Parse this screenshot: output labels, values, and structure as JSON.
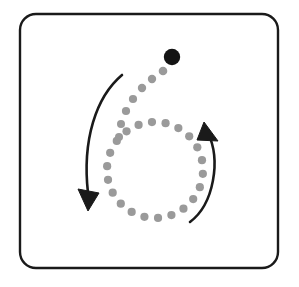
{
  "figure": {
    "canvas": {
      "width": 299,
      "height": 287,
      "background": "#ffffff"
    },
    "frame": {
      "label": "rounded-square-border",
      "x": 20,
      "y": 14,
      "width": 258,
      "height": 254,
      "corner_radius": 16,
      "stroke": "#1a1a1a",
      "stroke_width": 2.4,
      "fill": "#ffffff"
    },
    "ring": {
      "label": "dotted-circle-track",
      "center_x": 155,
      "center_y": 170,
      "radius": 48,
      "dot_count": 22,
      "dot_radius": 4.1,
      "color": "#9a9a9a",
      "start_angle_deg": -110
    },
    "tail": {
      "label": "spiral-lead-in-dots",
      "color": "#9a9a9a",
      "dots": [
        {
          "cx": 163,
          "cy": 71,
          "r": 4.3
        },
        {
          "cx": 152,
          "cy": 79,
          "r": 4.2
        },
        {
          "cx": 142,
          "cy": 88,
          "r": 4.2
        },
        {
          "cx": 133,
          "cy": 99,
          "r": 4.1
        },
        {
          "cx": 126,
          "cy": 111,
          "r": 4.1
        },
        {
          "cx": 121,
          "cy": 124,
          "r": 4.0
        },
        {
          "cx": 119,
          "cy": 137,
          "r": 4.0
        }
      ]
    },
    "moving_dot": {
      "label": "leading-black-dot",
      "cx": 172,
      "cy": 57,
      "r": 8.2,
      "color": "#141414"
    },
    "arrow_left": {
      "label": "outer-counterclockwise-arrow",
      "color": "#1a1a1a",
      "stroke_width": 2.6,
      "path": "M 122 75 C 96 97, 82 140, 88 193",
      "head": "M 88 211 L 78 189 L 99 193 Z",
      "direction": "down-left"
    },
    "arrow_right": {
      "label": "inner-counterclockwise-arrow",
      "color": "#1a1a1a",
      "stroke_width": 2.6,
      "path": "M 190 222 C 214 204, 221 160, 208 133",
      "head": "M 204 122 L 218 141 L 197 140 Z",
      "direction": "up-left"
    }
  }
}
